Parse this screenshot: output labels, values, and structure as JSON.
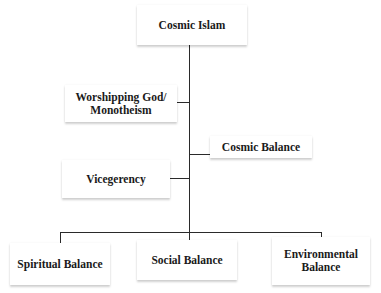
{
  "diagram": {
    "type": "hierarchy",
    "root": {
      "label": "Cosmic Islam"
    },
    "side_nodes": [
      {
        "label": "Worshipping God/ Monotheism",
        "line1": "Worshipping God/",
        "line2": "Monotheism",
        "side": "left"
      },
      {
        "label": "Cosmic Balance",
        "side": "right"
      },
      {
        "label": "Vicegerency",
        "side": "left"
      }
    ],
    "leaf_nodes": [
      {
        "label": "Spiritual Balance"
      },
      {
        "label": "Social Balance"
      },
      {
        "label": "Environmental Balance",
        "line1": "Environmental",
        "line2": "Balance"
      }
    ],
    "colors": {
      "line": "#2a2a2a",
      "text": "#1a1a1a",
      "box_bg": "#ffffff",
      "page_bg": "#ffffff"
    }
  }
}
